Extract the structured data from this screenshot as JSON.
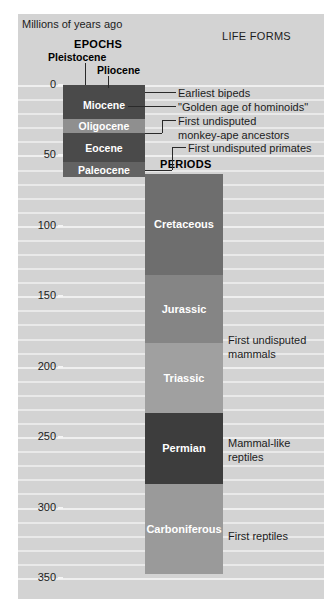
{
  "figure": {
    "title_left": "Millions of\nyears ago",
    "life_forms_header": "LIFE FORMS",
    "epochs_header": "EPOCHS",
    "periods_header": "PERIODS",
    "background_color": "#d3d3d3",
    "gridline_color": "#efefef"
  },
  "chart_data": {
    "type": "bar",
    "xlabel": "",
    "ylabel": "Millions of years ago",
    "ylim": [
      0,
      350
    ],
    "y_axis_inverted": true,
    "grid": true,
    "major_ticks": [
      0,
      50,
      100,
      150,
      200,
      250,
      300,
      350
    ],
    "minor_tick_interval": 10,
    "legend_position": "none",
    "tick_labels": [
      "0",
      "50",
      "100",
      "150",
      "200",
      "250",
      "300",
      "350"
    ],
    "series": [
      {
        "name": "EPOCHS",
        "column": "epochs",
        "values": [
          {
            "label": "Pleistocene",
            "start": 0,
            "end": 2,
            "color": "#4a4a4a",
            "label_placement": "callout-left"
          },
          {
            "label": "Pliocene",
            "start": 2,
            "end": 5,
            "color": "#4a4a4a",
            "label_placement": "callout-right"
          },
          {
            "label": "Miocene",
            "start": 5,
            "end": 24,
            "color": "#4a4a4a",
            "label_placement": "inside"
          },
          {
            "label": "Oligocene",
            "start": 24,
            "end": 34,
            "color": "#8f8f8f",
            "label_placement": "inside"
          },
          {
            "label": "Eocene",
            "start": 34,
            "end": 55,
            "color": "#4a4a4a",
            "label_placement": "inside"
          },
          {
            "label": "Paleocene",
            "start": 55,
            "end": 65,
            "color": "#636363",
            "label_placement": "inside"
          }
        ]
      },
      {
        "name": "PERIODS",
        "column": "periods",
        "values": [
          {
            "label": "Cretaceous",
            "start": 63,
            "end": 135,
            "color": "#6e6e6e",
            "label_placement": "inside"
          },
          {
            "label": "Jurassic",
            "start": 135,
            "end": 183,
            "color": "#858585",
            "label_placement": "inside"
          },
          {
            "label": "Triassic",
            "start": 183,
            "end": 233,
            "color": "#a0a0a0",
            "label_placement": "inside"
          },
          {
            "label": "Permian",
            "start": 233,
            "end": 283,
            "color": "#3d3d3d",
            "label_placement": "inside"
          },
          {
            "label": "Carboniferous",
            "start": 283,
            "end": 347,
            "color": "#9a9a9a",
            "label_placement": "inside"
          }
        ]
      }
    ],
    "annotations": [
      {
        "text": "Earliest bipeds",
        "at_mya": 5,
        "side": "right",
        "has_leader": true
      },
      {
        "text": "\"Golden age of hominoids\"",
        "at_mya": 15,
        "side": "right",
        "has_leader": true
      },
      {
        "text": "First undisputed\nmonkey-ape ancestors",
        "at_mya": 34,
        "side": "right",
        "has_leader": true
      },
      {
        "text": "First undisputed primates",
        "at_mya": 60,
        "side": "right",
        "has_leader": true
      },
      {
        "text": "First undisputed\nmammals",
        "at_mya": 183,
        "side": "right",
        "has_leader": false
      },
      {
        "text": "Mammal-like\nreptiles",
        "at_mya": 255,
        "side": "right",
        "has_leader": false
      },
      {
        "text": "First reptiles",
        "at_mya": 320,
        "side": "right",
        "has_leader": false
      }
    ]
  },
  "epoch_bands": [
    {
      "label": "Miocene",
      "color": "#4a4a4a"
    },
    {
      "label": "Oligocene",
      "color": "#8f8f8f"
    },
    {
      "label": "Eocene",
      "color": "#4a4a4a"
    },
    {
      "label": "Paleocene",
      "color": "#636363"
    }
  ],
  "epoch_callouts": [
    {
      "label": "Pleistocene"
    },
    {
      "label": "Pliocene"
    }
  ],
  "period_bands": [
    {
      "label": "Cretaceous",
      "color": "#6e6e6e"
    },
    {
      "label": "Jurassic",
      "color": "#858585"
    },
    {
      "label": "Triassic",
      "color": "#a0a0a0"
    },
    {
      "label": "Permian",
      "color": "#3d3d3d"
    },
    {
      "label": "Carboniferous",
      "color": "#9a9a9a"
    }
  ],
  "axis": {
    "labels": [
      "0",
      "50",
      "100",
      "150",
      "200",
      "250",
      "300",
      "350"
    ]
  },
  "annotations": [
    {
      "text": "Earliest bipeds"
    },
    {
      "text": "\"Golden age of hominoids\""
    },
    {
      "text": "First undisputed\nmonkey-ape ancestors"
    },
    {
      "text": "First undisputed primates"
    },
    {
      "text": "First undisputed\nmammals"
    },
    {
      "text": "Mammal-like\nreptiles"
    },
    {
      "text": "First reptiles"
    }
  ]
}
